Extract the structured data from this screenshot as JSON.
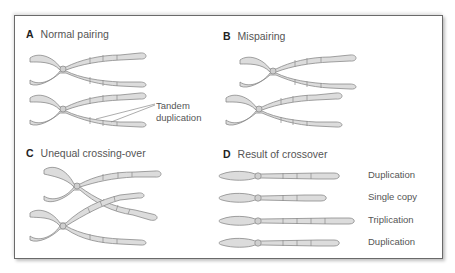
{
  "panels": {
    "A": {
      "letter": "A",
      "title": "Normal pairing",
      "annotation": [
        "Tandem",
        "duplication"
      ]
    },
    "B": {
      "letter": "B",
      "title": "Mispairing"
    },
    "C": {
      "letter": "C",
      "title": "Unequal crossing-over"
    },
    "D": {
      "letter": "D",
      "title": "Result of crossover",
      "results": [
        {
          "label": "Duplication"
        },
        {
          "label": "Single copy"
        },
        {
          "label": "Triplication"
        },
        {
          "label": "Duplication"
        }
      ]
    }
  },
  "colors": {
    "chromosome_fill": "#dcdcdc",
    "chromosome_stroke": "#8a8a8a",
    "frame_border": "#6a6a6a",
    "text": "#555555"
  }
}
